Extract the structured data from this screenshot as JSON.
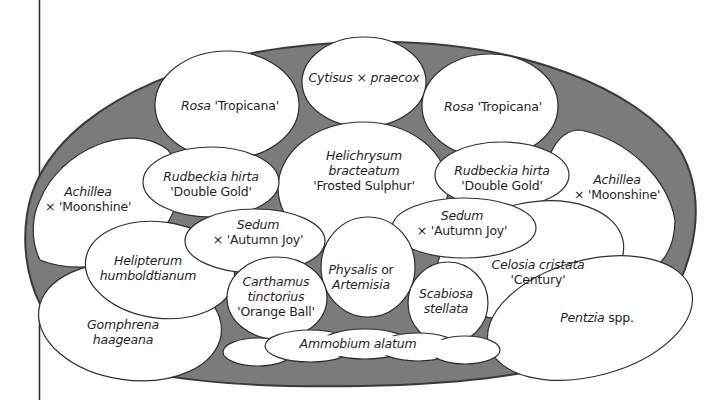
{
  "colors": {
    "background": "#ffffff",
    "bed_fill": "#7b7b7b",
    "bed_outline": "#3a3a3a",
    "plant_fill": "#ffffff",
    "plant_outline": "#2e2e2e",
    "text": "#1f1f1f",
    "margin_line": "#2a2a2a"
  },
  "plants": [
    {
      "id": "cytisus",
      "lines": [
        [
          {
            "t": "Cytisus ",
            "s": "it"
          },
          {
            "t": "× ",
            "s": "rm"
          },
          {
            "t": "praecox",
            "s": "it"
          }
        ]
      ]
    },
    {
      "id": "rosa-left",
      "lines": [
        [
          {
            "t": "Rosa ",
            "s": "it"
          },
          {
            "t": "'Tropicana'",
            "s": "rm"
          }
        ]
      ]
    },
    {
      "id": "rosa-right",
      "lines": [
        [
          {
            "t": "Rosa ",
            "s": "it"
          },
          {
            "t": "'Tropicana'",
            "s": "rm"
          }
        ]
      ]
    },
    {
      "id": "helichrysum",
      "lines": [
        [
          {
            "t": "Helichrysum",
            "s": "it"
          }
        ],
        [
          {
            "t": "bracteatum",
            "s": "it"
          }
        ],
        [
          {
            "t": "'Frosted Sulphur'",
            "s": "rm"
          }
        ]
      ]
    },
    {
      "id": "rudbeckia-left",
      "lines": [
        [
          {
            "t": "Rudbeckia hirta",
            "s": "it"
          }
        ],
        [
          {
            "t": "'Double Gold'",
            "s": "rm"
          }
        ]
      ]
    },
    {
      "id": "rudbeckia-right",
      "lines": [
        [
          {
            "t": "Rudbeckia hirta",
            "s": "it"
          }
        ],
        [
          {
            "t": "'Double Gold'",
            "s": "rm"
          }
        ]
      ]
    },
    {
      "id": "achillea-left",
      "lines": [
        [
          {
            "t": "Achillea",
            "s": "it"
          }
        ],
        [
          {
            "t": "× 'Moonshine'",
            "s": "rm"
          }
        ]
      ]
    },
    {
      "id": "achillea-right",
      "lines": [
        [
          {
            "t": "Achillea",
            "s": "it"
          }
        ],
        [
          {
            "t": "× 'Moonshine'",
            "s": "rm"
          }
        ]
      ]
    },
    {
      "id": "sedum-left",
      "lines": [
        [
          {
            "t": "Sedum",
            "s": "it"
          }
        ],
        [
          {
            "t": "× 'Autumn Joy'",
            "s": "rm"
          }
        ]
      ]
    },
    {
      "id": "sedum-right",
      "lines": [
        [
          {
            "t": "Sedum",
            "s": "it"
          }
        ],
        [
          {
            "t": "× 'Autumn Joy'",
            "s": "rm"
          }
        ]
      ]
    },
    {
      "id": "helipterum",
      "lines": [
        [
          {
            "t": "Helipterum",
            "s": "it"
          }
        ],
        [
          {
            "t": "humboldtianum",
            "s": "it"
          }
        ]
      ]
    },
    {
      "id": "physalis",
      "lines": [
        [
          {
            "t": "Physalis ",
            "s": "it"
          },
          {
            "t": "or",
            "s": "rm"
          }
        ],
        [
          {
            "t": "Artemisia",
            "s": "it"
          }
        ]
      ]
    },
    {
      "id": "carthamus",
      "lines": [
        [
          {
            "t": "Carthamus",
            "s": "it"
          }
        ],
        [
          {
            "t": "tinctorius",
            "s": "it"
          }
        ],
        [
          {
            "t": "'Orange Ball'",
            "s": "rm"
          }
        ]
      ]
    },
    {
      "id": "celosia",
      "lines": [
        [
          {
            "t": "Celosia cristata",
            "s": "it"
          }
        ],
        [
          {
            "t": "'Century'",
            "s": "rm"
          }
        ]
      ]
    },
    {
      "id": "scabiosa",
      "lines": [
        [
          {
            "t": "Scabiosa",
            "s": "it"
          }
        ],
        [
          {
            "t": "stellata",
            "s": "it"
          }
        ]
      ]
    },
    {
      "id": "gomphrena",
      "lines": [
        [
          {
            "t": "Gomphrena",
            "s": "it"
          }
        ],
        [
          {
            "t": "haageana",
            "s": "it"
          }
        ]
      ]
    },
    {
      "id": "pentzia",
      "lines": [
        [
          {
            "t": "Pentzia ",
            "s": "it"
          },
          {
            "t": "spp.",
            "s": "rm"
          }
        ]
      ]
    },
    {
      "id": "ammobium",
      "lines": [
        [
          {
            "t": "Ammobium alatum",
            "s": "it"
          }
        ]
      ]
    }
  ]
}
